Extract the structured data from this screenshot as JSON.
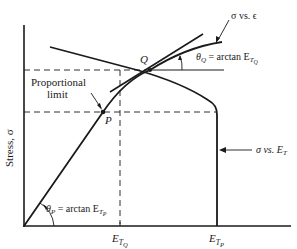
{
  "diagram": {
    "type": "stress-strain tangent modulus diagram",
    "y_axis_label": "Stress, σ",
    "x_ticks": [
      {
        "main": "E",
        "sub": "T",
        "subsub": "Q"
      },
      {
        "main": "E",
        "sub": "T",
        "subsub": "P"
      }
    ],
    "points": {
      "P": "P",
      "Q": "Q"
    },
    "annotations": {
      "proportional_limit_line1": "Proportional",
      "proportional_limit_line2": "limit",
      "sigma_vs_epsilon": "σ vs. ϵ",
      "sigma_vs_ET": "σ vs. E",
      "sigma_vs_ET_sub": "T",
      "theta_Q_prefix": "θ",
      "theta_Q_sub": "Q",
      "theta_Q_eq": " = arctan E",
      "theta_Q_E_sub": "T",
      "theta_Q_E_subsub": "Q",
      "theta_P_prefix": "θ",
      "theta_P_sub": "P",
      "theta_P_eq": " = arctan E",
      "theta_P_E_sub": "T",
      "theta_P_E_subsub": "P"
    },
    "colors": {
      "line": "#1a1a1a",
      "background": "#ffffff"
    }
  }
}
